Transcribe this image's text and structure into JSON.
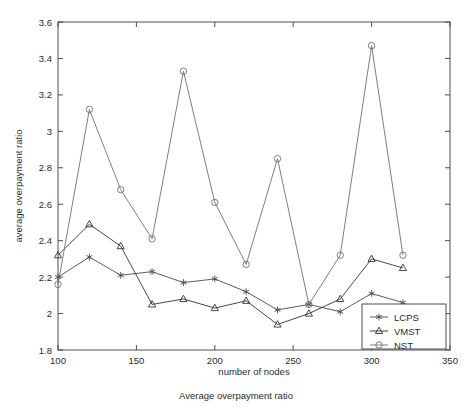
{
  "chart_data": {
    "type": "line",
    "title": "",
    "xlabel": "number of nodes",
    "ylabel": "average overpayment ratio",
    "caption": "Average overpayment ratio",
    "x": [
      100,
      120,
      140,
      160,
      180,
      200,
      220,
      240,
      260,
      280,
      300,
      320
    ],
    "xlim": [
      100,
      350
    ],
    "ylim": [
      1.8,
      3.6
    ],
    "xticks": [
      100,
      150,
      200,
      250,
      300,
      350
    ],
    "xtick_labels": [
      "100",
      "150",
      "200",
      "250",
      "300",
      "350"
    ],
    "yticks": [
      1.8,
      2.0,
      2.2,
      2.4,
      2.6,
      2.8,
      3.0,
      3.2,
      3.4,
      3.6
    ],
    "ytick_labels": [
      "1.8",
      "2",
      "2.2",
      "2.4",
      "2.6",
      "2.8",
      "3",
      "3.2",
      "3.4",
      "3.6"
    ],
    "grid": false,
    "legend_position": "lower right",
    "series": [
      {
        "name": "LCPS",
        "marker": "asterisk",
        "color": "#4a4a4a",
        "values": [
          2.2,
          2.31,
          2.21,
          2.23,
          2.17,
          2.19,
          2.12,
          2.02,
          2.05,
          2.01,
          2.11,
          2.06
        ]
      },
      {
        "name": "VMST",
        "marker": "triangle",
        "color": "#333333",
        "values": [
          2.32,
          2.49,
          2.37,
          2.05,
          2.08,
          2.03,
          2.07,
          1.94,
          2.0,
          2.08,
          2.3,
          2.25
        ]
      },
      {
        "name": "NST",
        "marker": "circle",
        "color": "#707070",
        "values": [
          2.16,
          3.12,
          2.68,
          2.41,
          3.33,
          2.61,
          2.27,
          2.85,
          2.05,
          2.32,
          3.47,
          2.32
        ]
      }
    ]
  },
  "legend": {
    "items": [
      {
        "label": "LCPS"
      },
      {
        "label": "VMST"
      },
      {
        "label": "NST"
      }
    ]
  },
  "axes": {
    "x_title": "number of nodes",
    "y_title": "average overpayment ratio"
  },
  "caption": {
    "text": "Average overpayment ratio"
  }
}
